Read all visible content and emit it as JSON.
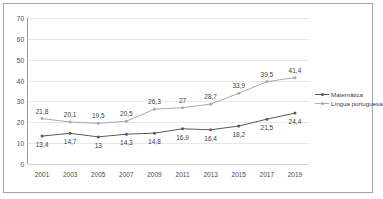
{
  "chart_data": {
    "type": "line",
    "title": "",
    "xlabel": "",
    "ylabel": "",
    "ylim": [
      0,
      70
    ],
    "yticks": [
      0,
      10,
      20,
      30,
      40,
      50,
      60,
      70
    ],
    "grid": true,
    "legend_position": "right",
    "categories": [
      "2001",
      "2003",
      "2005",
      "2007",
      "2009",
      "2011",
      "2013",
      "2015",
      "2017",
      "2019"
    ],
    "series": [
      {
        "name": "Matemática",
        "color": "#595959",
        "marker": "dot",
        "values": [
          13.4,
          14.7,
          13.0,
          14.3,
          14.8,
          16.9,
          16.4,
          18.2,
          21.5,
          24.4
        ],
        "labels": [
          "13,4",
          "14,7",
          "13",
          "14,3",
          "14,8",
          "16,9",
          "16,4",
          "18,2",
          "21,5",
          "24,4"
        ]
      },
      {
        "name": "Língua portuguesa",
        "color": "#aaaaaa",
        "marker": "dot",
        "values": [
          21.8,
          20.1,
          19.5,
          20.5,
          26.3,
          27.0,
          28.7,
          33.9,
          39.5,
          41.4
        ],
        "labels": [
          "21,8",
          "20,1",
          "19,5",
          "20,5",
          "26,3",
          "27",
          "28,7",
          "33,9",
          "39,5",
          "41,4"
        ]
      }
    ]
  },
  "axis": {
    "ytick_labels": [
      "70",
      "60",
      "50",
      "40",
      "30",
      "20",
      "10",
      "0"
    ],
    "xtick_labels": [
      "2001",
      "2003",
      "2005",
      "2007",
      "2009",
      "2011",
      "2013",
      "2015",
      "2017",
      "2019"
    ]
  },
  "legend": {
    "items": [
      {
        "label": "Matemática",
        "color": "#595959"
      },
      {
        "label": "Língua portuguesa",
        "color": "#aaaaaa"
      }
    ]
  },
  "colors": {
    "border": "#a6a6a6",
    "grid": "#e8e8e8",
    "axis": "#9a9a9a",
    "text": "#4a4a4a",
    "background": "#ffffff"
  }
}
